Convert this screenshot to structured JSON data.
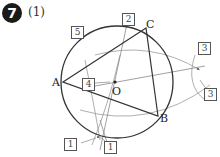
{
  "header": {
    "problem_number": "7",
    "part_label": "(1)"
  },
  "points": {
    "A": "A",
    "B": "B",
    "C": "C",
    "O": "O"
  },
  "step_labels": [
    {
      "id": "label-5-top",
      "text": "5"
    },
    {
      "id": "label-2-top",
      "text": "2"
    },
    {
      "id": "label-3-upper-right",
      "text": "3"
    },
    {
      "id": "label-3-lower-right",
      "text": "3"
    },
    {
      "id": "label-4-center",
      "text": "4"
    },
    {
      "id": "label-1-bottom-left",
      "text": "1"
    },
    {
      "id": "label-1-bottom",
      "text": "1"
    }
  ],
  "colors": {
    "circle": "#333333",
    "triangle": "#333333",
    "construction": "#999999",
    "badge": "#1a1a1a"
  }
}
